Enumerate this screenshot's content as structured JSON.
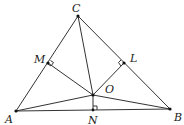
{
  "diagram": {
    "type": "geometry",
    "points": {
      "A": {
        "label": "A",
        "x": 16,
        "y": 111
      },
      "B": {
        "label": "B",
        "x": 170,
        "y": 109
      },
      "C": {
        "label": "C",
        "x": 78,
        "y": 16
      },
      "M": {
        "label": "M",
        "x": 48,
        "y": 63
      },
      "L": {
        "label": "L",
        "x": 124,
        "y": 63
      },
      "O": {
        "label": "O",
        "x": 93,
        "y": 95
      },
      "N": {
        "label": "N",
        "x": 93,
        "y": 110
      }
    },
    "segments": [
      "AB",
      "BC",
      "CA",
      "CO",
      "AO",
      "BO",
      "MO",
      "LO",
      "NO"
    ],
    "right_angles": [
      "M",
      "L",
      "N"
    ],
    "colors": {
      "stroke": "#333333",
      "background": "#ffffff"
    }
  }
}
